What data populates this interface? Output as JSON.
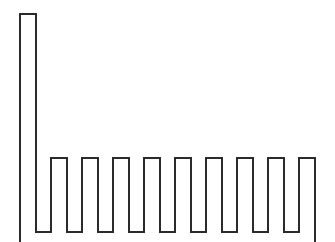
{
  "figure": {
    "type": "line-drawing",
    "title": "",
    "background_color": "#ffffff",
    "width": 335,
    "height": 242
  },
  "chart_data": {
    "type": "bar",
    "title": "",
    "subtitle": "",
    "xlabel": "",
    "ylabel": "",
    "categories": [
      "1",
      "2",
      "3",
      "4",
      "5",
      "6",
      "7",
      "8",
      "9",
      "10"
    ],
    "values": [
      218,
      74,
      74,
      74,
      74,
      74,
      74,
      74,
      74,
      74
    ],
    "values_normalized": [
      1.0,
      0.34,
      0.34,
      0.34,
      0.34,
      0.34,
      0.34,
      0.34,
      0.34,
      0.34
    ],
    "bar_count": 10,
    "tall_bar_index": 0,
    "xlim": [
      0,
      335
    ],
    "ylim": [
      0,
      242
    ],
    "grid": false,
    "legend": null,
    "axis_visible": false,
    "tick_labels_visible": false,
    "annotations": [],
    "baseline_y": 232,
    "tall_bar_top_y": 14,
    "short_bar_top_y": 158,
    "bar_width": 18,
    "bar_period": 31,
    "bar_left_edges": [
      19,
      50,
      81,
      112,
      143,
      174,
      205,
      236,
      267,
      298
    ],
    "last_bar_right_edge": 316,
    "truncated_right": true
  },
  "style": {
    "stroke_color": "#2b2b2b",
    "stroke_width": 2,
    "fill_color": "none",
    "background_color": "#ffffff"
  },
  "geometry": {
    "path_d": "M 20,242 L 20,14 L 36,14 L 36,232 L 51,232 L 51,158 L 67,158 L 67,232 L 82,232 L 82,158 L 98,158 L 98,232 L 113,232 L 113,158 L 129,158 L 129,232 L 144,232 L 144,158 L 160,158 L 160,232 L 175,232 L 175,158 L 191,158 L 191,232 L 206,232 L 206,158 L 222,158 L 222,232 L 237,232 L 237,158 L 253,158 L 253,232 L 268,232 L 268,158 L 284,158 L 284,232 L 299,232 L 299,158 L 315,158 L 315,242"
  }
}
